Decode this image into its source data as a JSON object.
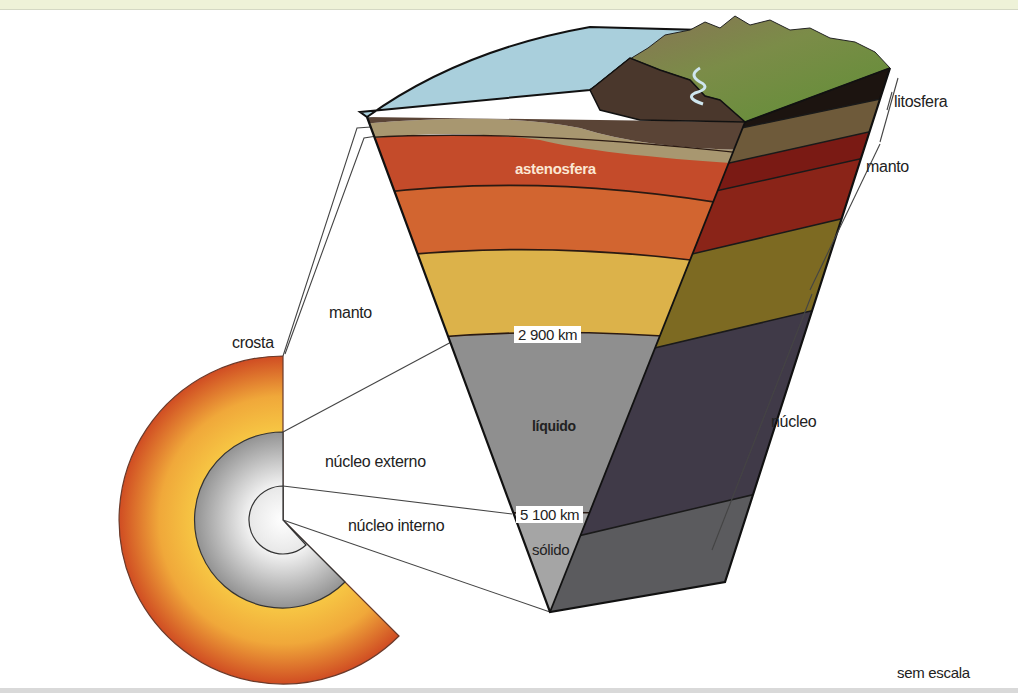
{
  "figure": {
    "scale_note": "sem escala"
  },
  "labels": {
    "crosta": "crosta",
    "manto_left": "manto",
    "nucleo_externo": "núcleo externo",
    "nucleo_interno": "núcleo interno",
    "astenosfera": "astenosfera",
    "liquido": "líquido",
    "solido": "sólido",
    "litosfera": "litosfera",
    "manto_right": "manto",
    "nucleo_right": "núcleo"
  },
  "depth_markers": [
    {
      "value": "2 900 km",
      "boundary": "manto / núcleo externo"
    },
    {
      "value": "5 100 km",
      "boundary": "núcleo externo / núcleo interno"
    }
  ],
  "colors": {
    "ocean": "#a9cfdc",
    "crust_dark": "#5a4436",
    "crust_light": "#a89770",
    "asthenosphere": "#c8492a",
    "upper_mantle": "#d4682f",
    "lower_mantle": "#e0b040",
    "outer_core": "#8e8e8e",
    "inner_core": "#a8a8a8",
    "grass": "#6f9a3a",
    "mountain": "#6b5444",
    "top_band": "#eef2d8"
  }
}
